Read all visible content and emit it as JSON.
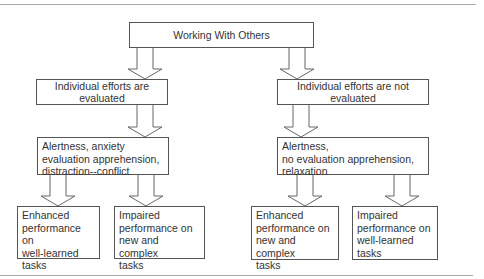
{
  "diagram": {
    "root": {
      "label": "Working With Others"
    },
    "branches": [
      {
        "condition": {
          "lines": [
            "Individual efforts are",
            "evaluated"
          ]
        },
        "state": {
          "lines": [
            "Alertness, anxiety",
            "evaluation apprehension,",
            "distraction--conflict"
          ]
        },
        "outcomes": [
          {
            "lines": [
              "Enhanced",
              "performance on",
              "well-learned",
              "tasks"
            ]
          },
          {
            "lines": [
              "Impaired",
              "performance on",
              "new and complex",
              "tasks"
            ]
          }
        ]
      },
      {
        "condition": {
          "lines": [
            "Individual efforts are not",
            "evaluated"
          ]
        },
        "state": {
          "lines": [
            "Alertness,",
            "no evaluation apprehension,",
            "relaxation"
          ]
        },
        "outcomes": [
          {
            "lines": [
              "Enhanced",
              "performance on",
              "new and complex",
              "tasks"
            ]
          },
          {
            "lines": [
              "Impaired",
              "performance on",
              "well-learned",
              "tasks"
            ]
          }
        ]
      }
    ],
    "colors": {
      "box_border": "#555555",
      "arrow_stroke": "#666666",
      "text": "#333333",
      "rule": "#a8a8a8"
    }
  }
}
